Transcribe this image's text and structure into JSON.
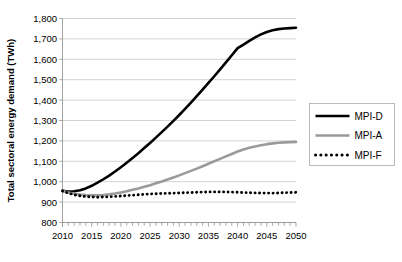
{
  "chart_data": {
    "type": "line",
    "title": "",
    "xlabel": "",
    "ylabel": "Total sectoral energy demand (TWh)",
    "xlim": [
      2010,
      2050
    ],
    "ylim": [
      800,
      1800
    ],
    "ytick_labels": [
      "1,800",
      "1,700",
      "1,600",
      "1,500",
      "1,400",
      "1,300",
      "1,200",
      "1,100",
      "1,000",
      "900",
      "800"
    ],
    "ytick_values": [
      1800,
      1700,
      1600,
      1500,
      1400,
      1300,
      1200,
      1100,
      1000,
      900,
      800
    ],
    "xtick_labels": [
      "2010",
      "2015",
      "2020",
      "2025",
      "2030",
      "2035",
      "2040",
      "2045",
      "2050"
    ],
    "xtick_values": [
      2010,
      2015,
      2020,
      2025,
      2030,
      2035,
      2040,
      2045,
      2050
    ],
    "minor_xtick_step": 1,
    "grid": "horizontal",
    "legend_position": "right",
    "x": [
      2010,
      2011,
      2012,
      2013,
      2014,
      2015,
      2016,
      2017,
      2018,
      2019,
      2020,
      2021,
      2022,
      2023,
      2024,
      2025,
      2026,
      2027,
      2028,
      2029,
      2030,
      2031,
      2032,
      2033,
      2034,
      2035,
      2036,
      2037,
      2038,
      2039,
      2040,
      2041,
      2042,
      2043,
      2044,
      2045,
      2046,
      2047,
      2048,
      2049,
      2050
    ],
    "series": [
      {
        "name": "MPI-D",
        "color": "#000000",
        "style": "solid",
        "width": 2.6,
        "values": [
          955,
          952,
          953,
          958,
          967,
          980,
          995,
          1012,
          1030,
          1050,
          1071,
          1093,
          1116,
          1140,
          1165,
          1190,
          1216,
          1243,
          1270,
          1298,
          1327,
          1357,
          1388,
          1419,
          1451,
          1484,
          1517,
          1551,
          1585,
          1620,
          1655,
          1672,
          1690,
          1707,
          1722,
          1734,
          1742,
          1748,
          1751,
          1753,
          1755
        ]
      },
      {
        "name": "MPI-A",
        "color": "#9a9a9a",
        "style": "solid",
        "width": 2.6,
        "values": [
          955,
          947,
          941,
          937,
          934,
          933,
          933,
          935,
          938,
          942,
          947,
          953,
          960,
          967,
          975,
          983,
          992,
          1001,
          1011,
          1021,
          1031,
          1042,
          1053,
          1064,
          1076,
          1088,
          1100,
          1112,
          1124,
          1136,
          1148,
          1158,
          1166,
          1173,
          1179,
          1184,
          1188,
          1191,
          1193,
          1194,
          1195
        ]
      },
      {
        "name": "MPI-F",
        "color": "#000000",
        "style": "dotted",
        "width": 2.6,
        "values": [
          955,
          944,
          936,
          931,
          927,
          925,
          924,
          925,
          926,
          928,
          930,
          932,
          934,
          936,
          938,
          940,
          941,
          942,
          943,
          944,
          945,
          946,
          947,
          948,
          949,
          950,
          950,
          950,
          950,
          949,
          948,
          947,
          946,
          945,
          944,
          944,
          944,
          945,
          946,
          947,
          948
        ]
      }
    ]
  },
  "legend": {
    "entries": [
      {
        "label": "MPI-D"
      },
      {
        "label": "MPI-A"
      },
      {
        "label": "MPI-F"
      }
    ]
  },
  "colors": {
    "mpi_d": "#000000",
    "mpi_a": "#9a9a9a",
    "mpi_f": "#000000",
    "grid": "#c8c8c8",
    "axis": "#9a9a9a",
    "background": "#ffffff"
  }
}
